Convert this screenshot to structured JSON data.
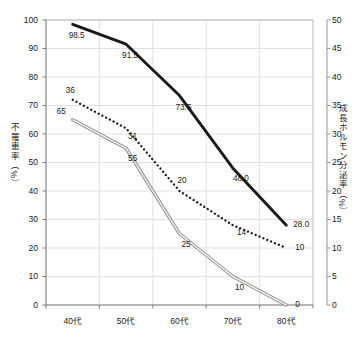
{
  "chart_data": {
    "type": "line",
    "title": "",
    "xlabel": "",
    "ylabel": "不罹患率（%）",
    "y2label": "成長ホルモン分泌率（%）",
    "categories": [
      "40代",
      "50代",
      "60代",
      "70代",
      "80代"
    ],
    "grid": true,
    "legend": "none",
    "ylim": [
      0,
      100
    ],
    "y2lim": [
      0,
      50
    ],
    "yticks": [
      "0",
      "10",
      "20",
      "30",
      "40",
      "50",
      "60",
      "70",
      "80",
      "90",
      "100"
    ],
    "y2ticks": [
      "0",
      "5",
      "10",
      "15",
      "20",
      "25",
      "30",
      "35",
      "40",
      "45",
      "50"
    ],
    "series": [
      {
        "name": "不罹患率 黒実線",
        "axis": "left",
        "style": "solid-thick-black",
        "color": "#1a1a1a",
        "values": [
          98.5,
          91.5,
          73.5,
          48.0,
          28.0
        ],
        "labels": [
          "98.5",
          "91.5",
          "73.5",
          "48.0",
          "28.0"
        ]
      },
      {
        "name": "成長ホルモン分泌率 点線",
        "axis": "right",
        "style": "dotted-black",
        "color": "#1a1a1a",
        "values": [
          36,
          31,
          20,
          14,
          10
        ],
        "labels": [
          "36",
          "31",
          "20",
          "14",
          "10"
        ]
      },
      {
        "name": "不罹患率 灰実線",
        "axis": "left",
        "style": "solid-double-gray",
        "color": "#808080",
        "values": [
          65,
          55,
          25,
          10,
          0
        ],
        "labels": [
          "65",
          "55",
          "25",
          "10",
          "0"
        ]
      }
    ]
  }
}
